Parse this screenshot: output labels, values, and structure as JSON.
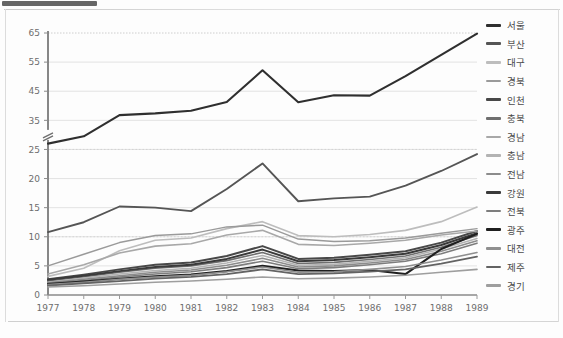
{
  "page": {
    "background": "#fdfdfd",
    "frame_color": "#d9d9d9"
  },
  "chart_data": {
    "type": "line",
    "title": "",
    "subtitle": "",
    "xlabel": "",
    "ylabel": "",
    "grid": true,
    "legend_position": "right",
    "axis_break": {
      "present": true,
      "between": [
        25,
        35
      ]
    },
    "ylim": [
      0,
      65
    ],
    "ytick_labels": [
      "0",
      "5",
      "10",
      "15",
      "20",
      "25",
      "35",
      "45",
      "55",
      "65"
    ],
    "yticks": [
      0,
      5,
      10,
      15,
      20,
      25,
      35,
      45,
      55,
      65
    ],
    "categories": [
      "1977",
      "1978",
      "1979",
      "1980",
      "1981",
      "1982",
      "1983",
      "1984",
      "1985",
      "1986",
      "1987",
      "1988",
      "1989"
    ],
    "x": [
      1977,
      1978,
      1979,
      1980,
      1981,
      1982,
      1983,
      1984,
      1985,
      1986,
      1987,
      1988,
      1989
    ],
    "series": [
      {
        "name": "서울",
        "color": "#2f2f2f",
        "width": 2.1,
        "values": [
          27.0,
          29.5,
          36.8,
          37.4,
          38.3,
          41.3,
          52.2,
          41.2,
          43.6,
          43.5,
          50.2,
          57.5,
          64.8
        ]
      },
      {
        "name": "부산",
        "color": "#555555",
        "width": 1.9,
        "values": [
          10.8,
          12.5,
          15.2,
          15.0,
          14.4,
          18.2,
          22.6,
          16.1,
          16.6,
          16.9,
          18.8,
          21.3,
          24.2
        ]
      },
      {
        "name": "대구",
        "color": "#bdbdbd",
        "width": 1.6,
        "values": [
          3.2,
          4.6,
          7.6,
          9.4,
          9.8,
          11.4,
          12.6,
          10.2,
          10.0,
          10.4,
          11.1,
          12.6,
          15.1
        ]
      },
      {
        "name": "경북",
        "color": "#9a9a9a",
        "width": 1.5,
        "values": [
          5.0,
          7.0,
          9.0,
          10.2,
          10.5,
          11.7,
          12.0,
          9.6,
          9.2,
          9.3,
          9.8,
          10.6,
          11.4
        ]
      },
      {
        "name": "인천",
        "color": "#484848",
        "width": 2.0,
        "values": [
          2.7,
          3.5,
          4.4,
          5.2,
          5.6,
          6.7,
          8.4,
          6.2,
          6.4,
          6.9,
          7.5,
          9.0,
          11.0
        ]
      },
      {
        "name": "충북",
        "color": "#6f6f6f",
        "width": 1.6,
        "values": [
          2.4,
          3.1,
          3.9,
          4.6,
          5.0,
          5.9,
          7.3,
          5.4,
          5.6,
          6.1,
          6.7,
          8.2,
          10.2
        ]
      },
      {
        "name": "경남",
        "color": "#a8a8a8",
        "width": 1.6,
        "values": [
          3.6,
          5.2,
          7.2,
          8.4,
          8.8,
          10.3,
          11.1,
          8.7,
          8.5,
          8.9,
          9.4,
          10.3,
          11.0
        ]
      },
      {
        "name": "충남",
        "color": "#b3b3b3",
        "width": 1.5,
        "values": [
          2.2,
          2.9,
          3.6,
          4.2,
          4.6,
          5.5,
          6.8,
          5.1,
          5.3,
          5.8,
          6.4,
          7.9,
          9.7
        ]
      },
      {
        "name": "전남",
        "color": "#8c8c8c",
        "width": 1.6,
        "values": [
          2.1,
          2.7,
          3.3,
          3.9,
          4.3,
          5.1,
          6.3,
          4.8,
          5.0,
          5.5,
          6.1,
          7.5,
          9.3
        ]
      },
      {
        "name": "강원",
        "color": "#3a3a3a",
        "width": 2.0,
        "values": [
          2.6,
          3.3,
          4.1,
          4.8,
          5.2,
          6.2,
          7.8,
          5.8,
          6.0,
          6.5,
          7.1,
          8.6,
          10.6
        ]
      },
      {
        "name": "전북",
        "color": "#7d7d7d",
        "width": 1.6,
        "values": [
          2.0,
          2.5,
          3.1,
          3.6,
          4.0,
          4.7,
          5.8,
          4.5,
          4.7,
          5.2,
          5.8,
          7.1,
          8.9
        ]
      },
      {
        "name": "광주",
        "color": "#1f1f1f",
        "width": 2.1,
        "values": [
          1.9,
          2.3,
          2.8,
          3.2,
          3.5,
          4.1,
          5.0,
          4.2,
          4.1,
          4.3,
          3.6,
          7.9,
          10.5
        ]
      },
      {
        "name": "대전",
        "color": "#8f8f8f",
        "width": 1.6,
        "values": [
          1.8,
          2.2,
          2.7,
          3.1,
          3.4,
          4.0,
          4.8,
          3.9,
          4.0,
          4.4,
          4.9,
          6.0,
          7.3
        ]
      },
      {
        "name": "제주",
        "color": "#636363",
        "width": 1.8,
        "values": [
          1.6,
          2.0,
          2.4,
          2.8,
          3.1,
          3.6,
          4.4,
          3.6,
          3.7,
          4.0,
          4.4,
          5.4,
          6.6
        ]
      },
      {
        "name": "경기",
        "color": "#9e9e9e",
        "width": 1.6,
        "values": [
          1.4,
          1.6,
          1.9,
          2.2,
          2.4,
          2.7,
          3.1,
          2.8,
          2.9,
          3.1,
          3.4,
          3.9,
          4.4
        ]
      }
    ]
  },
  "legend": {
    "items": [
      {
        "label": "서울"
      },
      {
        "label": "부산"
      },
      {
        "label": "대구"
      },
      {
        "label": "경북"
      },
      {
        "label": "인천"
      },
      {
        "label": "충북"
      },
      {
        "label": "경남"
      },
      {
        "label": "충남"
      },
      {
        "label": "전남"
      },
      {
        "label": "강원"
      },
      {
        "label": "전북"
      },
      {
        "label": "광주"
      },
      {
        "label": "대전"
      },
      {
        "label": "제주"
      },
      {
        "label": "경기"
      }
    ]
  }
}
